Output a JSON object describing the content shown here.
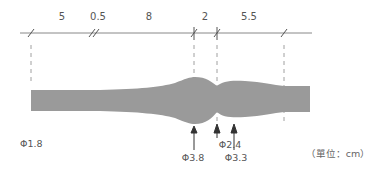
{
  "diagram": {
    "type": "dimensioned-profile",
    "segments": [
      {
        "label": "5"
      },
      {
        "label": "0.5"
      },
      {
        "label": "8"
      },
      {
        "label": "2"
      },
      {
        "label": "5.5"
      }
    ],
    "diameters": [
      {
        "label": "Φ1.8"
      },
      {
        "label": "Φ3.8"
      },
      {
        "label": "Φ2.4"
      },
      {
        "label": "Φ3.3"
      }
    ],
    "unit_note": "（單位：cm）",
    "colors": {
      "shape_fill": "#9a9a9a",
      "line": "#777777",
      "text": "#555555"
    }
  }
}
